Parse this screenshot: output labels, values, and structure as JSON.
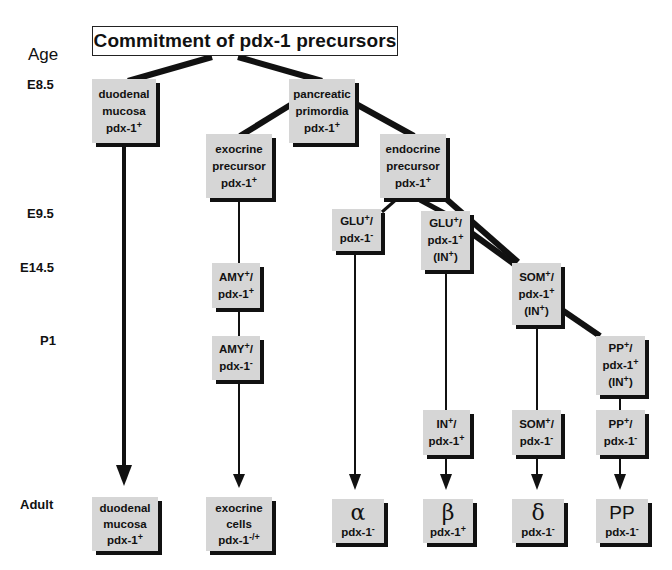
{
  "title": "Commitment of pdx-1 precursors",
  "age_axis": {
    "heading": "Age",
    "stages": [
      "E8.5",
      "E9.5",
      "E14.5",
      "P1",
      "Adult"
    ]
  },
  "nodes": {
    "duodenal_e85": {
      "lines": [
        "duodenal",
        "mucosa"
      ],
      "marker": "pdx-1",
      "sign": "+"
    },
    "pancreatic_primordia": {
      "lines": [
        "pancreatic",
        "primordia"
      ],
      "marker": "pdx-1",
      "sign": "+"
    },
    "exocrine_precursor": {
      "lines": [
        "exocrine",
        "precursor"
      ],
      "marker": "pdx-1",
      "sign": "+"
    },
    "endocrine_precursor": {
      "lines": [
        "endocrine",
        "precursor"
      ],
      "marker": "pdx-1",
      "sign": "+"
    },
    "glu_pdx_neg": {
      "l1": "GLU",
      "l1sign": "+",
      "l2": "pdx-1",
      "l2sign": "-"
    },
    "glu_pdx_pos": {
      "l1": "GLU",
      "l1sign": "+",
      "l2": "pdx-1",
      "l2sign": "+",
      "l3": "(IN",
      "l3sign": "+"
    },
    "som_pdx_pos": {
      "l1": "SOM",
      "l1sign": "+",
      "l2": "pdx-1",
      "l2sign": "+",
      "l3": "(IN",
      "l3sign": "+"
    },
    "pp_pdx_pos": {
      "l1": "PP",
      "l1sign": "+",
      "l2": "pdx-1",
      "l2sign": "+",
      "l3": "(IN",
      "l3sign": "+"
    },
    "amy_pdx_pos": {
      "l1": "AMY",
      "l1sign": "+",
      "l2": "pdx-1",
      "l2sign": "+"
    },
    "amy_pdx_neg": {
      "l1": "AMY",
      "l1sign": "+",
      "l2": "pdx-1",
      "l2sign": "-"
    },
    "in_pdx_pos": {
      "l1": "IN",
      "l1sign": "+",
      "l2": "pdx-1",
      "l2sign": "+"
    },
    "som_pdx_neg": {
      "l1": "SOM",
      "l1sign": "+",
      "l2": "pdx-1",
      "l2sign": "-"
    },
    "pp_pdx_neg": {
      "l1": "PP",
      "l1sign": "+",
      "l2": "pdx-1",
      "l2sign": "-"
    }
  },
  "adult": {
    "duodenal": {
      "lines": [
        "duodenal",
        "mucosa"
      ],
      "marker": "pdx-1",
      "sign": "+"
    },
    "exocrine": {
      "lines": [
        "exocrine",
        "cells"
      ],
      "marker": "pdx-1",
      "sign": "-/+"
    },
    "alpha": {
      "symbol": "α",
      "marker": "pdx-1",
      "sign": "-"
    },
    "beta": {
      "symbol": "β",
      "marker": "pdx-1",
      "sign": "+"
    },
    "delta": {
      "symbol": "δ",
      "marker": "pdx-1",
      "sign": "-"
    },
    "pp": {
      "symbol": "PP",
      "marker": "pdx-1",
      "sign": "-"
    }
  },
  "colors": {
    "box_fill": "#d6d6d6",
    "shadow": "#111111",
    "line": "#111111"
  }
}
